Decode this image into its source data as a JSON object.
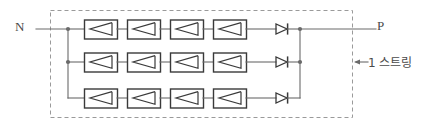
{
  "diagram": {
    "terminals": {
      "negative_label": "N",
      "positive_label": "P"
    },
    "annotation": {
      "label": "1 스트링",
      "arrow": "left-arrow",
      "points_to": "string-boundary"
    },
    "boundary": {
      "style": "dashed",
      "color": "#999999",
      "x": 50,
      "y": 10,
      "width": 302,
      "height": 107
    },
    "colors": {
      "wire": "#6a6a6a",
      "module_border": "#3a3a3a",
      "module_fill": "#ffffff",
      "boundary": "#9a9a9a",
      "text": "#4a4a4a"
    },
    "geometry": {
      "left_bus_x": 68,
      "right_bus_x": 300,
      "module_width": 33,
      "module_height": 19,
      "module_x_positions": [
        84,
        127,
        170,
        213
      ],
      "diode_x": 276,
      "n_lead_start_x": 36,
      "p_lead_end_x": 376
    },
    "rows": [
      {
        "name": "string-row-1",
        "y": 29,
        "left_junction": true,
        "right_junction": true,
        "modules": [
          {
            "name": "pv-module",
            "symbol": "pv-cell-triangle"
          },
          {
            "name": "pv-module",
            "symbol": "pv-cell-triangle"
          },
          {
            "name": "pv-module",
            "symbol": "pv-cell-triangle"
          },
          {
            "name": "pv-module",
            "symbol": "pv-cell-triangle"
          }
        ],
        "diode": {
          "name": "blocking-diode",
          "symbol": "diode"
        }
      },
      {
        "name": "string-row-2",
        "y": 62,
        "left_junction": true,
        "right_junction": true,
        "modules": [
          {
            "name": "pv-module",
            "symbol": "pv-cell-triangle"
          },
          {
            "name": "pv-module",
            "symbol": "pv-cell-triangle"
          },
          {
            "name": "pv-module",
            "symbol": "pv-cell-triangle"
          },
          {
            "name": "pv-module",
            "symbol": "pv-cell-triangle"
          }
        ],
        "diode": {
          "name": "blocking-diode",
          "symbol": "diode"
        }
      },
      {
        "name": "string-row-3",
        "y": 98,
        "left_junction": false,
        "right_junction": false,
        "modules": [
          {
            "name": "pv-module",
            "symbol": "pv-cell-triangle"
          },
          {
            "name": "pv-module",
            "symbol": "pv-cell-triangle"
          },
          {
            "name": "pv-module",
            "symbol": "pv-cell-triangle"
          },
          {
            "name": "pv-module",
            "symbol": "pv-cell-triangle"
          }
        ],
        "diode": {
          "name": "blocking-diode",
          "symbol": "diode"
        }
      }
    ]
  }
}
